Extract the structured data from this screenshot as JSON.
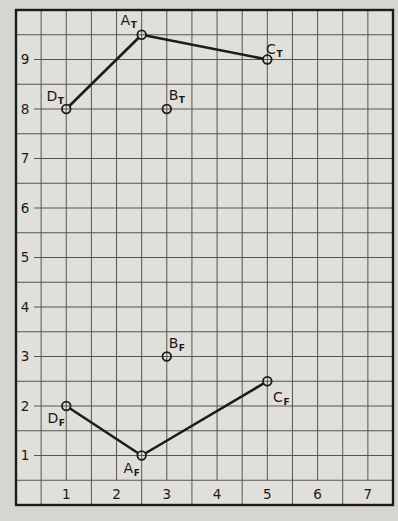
{
  "figure": {
    "paper_color": "#d6d5cf",
    "plot_paper_color": "#e0dfd9",
    "grid_color": "#3f3f3b",
    "ink_color": "#1c1c1c",
    "text_color": "#1a1a1a"
  },
  "chart_data": {
    "type": "scatter",
    "title": "",
    "xlabel": "",
    "ylabel": "",
    "xlim": [
      0,
      7.5
    ],
    "ylim": [
      0,
      10
    ],
    "grid_step": 0.5,
    "grid_on": true,
    "marker_style": "open-circle",
    "x_ticks": [
      1,
      2,
      3,
      4,
      5,
      6,
      7
    ],
    "y_ticks": [
      1,
      2,
      3,
      4,
      5,
      6,
      7,
      8,
      9
    ],
    "points": [
      {
        "id": "DT",
        "label": "D",
        "sub": "T",
        "x": 1,
        "y": 8,
        "label_dx": -11,
        "label_dy": -8
      },
      {
        "id": "AT",
        "label": "A",
        "sub": "T",
        "x": 2.5,
        "y": 9.5,
        "label_dx": -13,
        "label_dy": -10
      },
      {
        "id": "BT",
        "label": "B",
        "sub": "T",
        "x": 3,
        "y": 8,
        "label_dx": 10,
        "label_dy": -9
      },
      {
        "id": "CT",
        "label": "C",
        "sub": "T",
        "x": 5,
        "y": 9,
        "label_dx": 7,
        "label_dy": -6
      },
      {
        "id": "DF",
        "label": "D",
        "sub": "F",
        "x": 1,
        "y": 2,
        "label_dx": -10,
        "label_dy": 17
      },
      {
        "id": "AF",
        "label": "A",
        "sub": "F",
        "x": 2.5,
        "y": 1,
        "label_dx": -10,
        "label_dy": 17
      },
      {
        "id": "BF",
        "label": "B",
        "sub": "F",
        "x": 3,
        "y": 3,
        "label_dx": 10,
        "label_dy": -9
      },
      {
        "id": "CF",
        "label": "C",
        "sub": "F",
        "x": 5,
        "y": 2.5,
        "label_dx": 14,
        "label_dy": 21
      }
    ],
    "segments": [
      [
        "DT",
        "AT"
      ],
      [
        "AT",
        "CT"
      ],
      [
        "DF",
        "AF"
      ],
      [
        "AF",
        "CF"
      ]
    ],
    "series": [
      {
        "name": "T",
        "connected_points": [
          "DT",
          "AT",
          "CT"
        ],
        "isolated_points": [
          "BT"
        ]
      },
      {
        "name": "F",
        "connected_points": [
          "DF",
          "AF",
          "CF"
        ],
        "isolated_points": [
          "BF"
        ]
      }
    ]
  }
}
